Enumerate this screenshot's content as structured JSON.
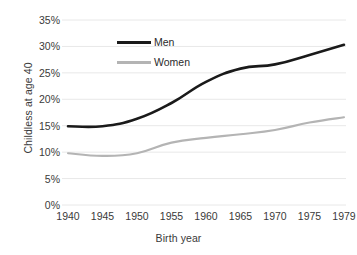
{
  "chart_data": {
    "type": "line",
    "title": "",
    "xlabel": "Birth year",
    "ylabel": "Childless at age 40",
    "categories": [
      "1940",
      "1945",
      "1950",
      "1955",
      "1960",
      "1965",
      "1970",
      "1975",
      "1979"
    ],
    "x": [
      1940,
      1945,
      1950,
      1955,
      1960,
      1965,
      1970,
      1975,
      1979
    ],
    "series": [
      {
        "name": "Men",
        "color": "#1a1a1a",
        "values": [
          14.9,
          14.9,
          16.3,
          19.3,
          23.3,
          25.8,
          26.6,
          28.4,
          30.3
        ]
      },
      {
        "name": "Women",
        "color": "#b4b4b4",
        "values": [
          9.8,
          9.3,
          9.8,
          11.8,
          12.7,
          13.4,
          14.2,
          15.6,
          16.6
        ]
      }
    ],
    "ylim": [
      0,
      35
    ],
    "yticks": [
      0,
      5,
      10,
      15,
      20,
      25,
      30,
      35
    ],
    "ytick_labels": [
      "0%",
      "5%",
      "10%",
      "15%",
      "20%",
      "25%",
      "30%",
      "35%"
    ],
    "grid": true,
    "grid_color": "#e8e8e8",
    "legend_position": "inside-top-left",
    "units": "percent"
  },
  "axes": {
    "y_title": "Childless at age 40",
    "x_title": "Birth year"
  },
  "legend": {
    "entries": [
      {
        "label": "Men"
      },
      {
        "label": "Women"
      }
    ]
  }
}
